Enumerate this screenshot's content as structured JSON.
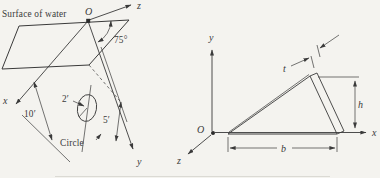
{
  "left": {
    "surface_label": "Surface of water",
    "origin_label": "O",
    "axis_z_label": "z",
    "axis_x_label": "x",
    "axis_y_label": "y",
    "angle_label": "75°",
    "dim_depth_label": "10′",
    "dim_radius_label": "2′",
    "dim_offset_label": "5′",
    "circle_label": "Circle"
  },
  "right": {
    "origin_label": "O",
    "axis_x_label": "x",
    "axis_y_label": "y",
    "axis_z_label": "z",
    "thickness_label": "t",
    "height_label": "h",
    "base_label": "b"
  },
  "colors": {
    "paper": "#f4f3ef",
    "ink": "#3a3a3a",
    "surface_fill": "#dcdbd6",
    "gate_fill": "#c6c5c0",
    "plate_fill": "#d6d5d0"
  }
}
